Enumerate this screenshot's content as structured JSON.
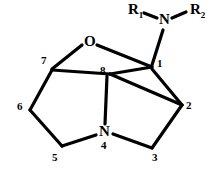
{
  "figure": {
    "kind": "chemical-structure-diagram",
    "width": 220,
    "height": 172,
    "background_color": "#ffffff",
    "line_color": "#000000"
  },
  "atoms": {
    "oxygen": {
      "label": "O",
      "x": 89,
      "y": 41
    },
    "ring_nitrogen": {
      "label": "N",
      "x": 104,
      "y": 133
    },
    "amine_nitrogen": {
      "label": "N",
      "x": 164,
      "y": 20
    }
  },
  "substituents": {
    "r1": {
      "label": "R",
      "subscript": "1",
      "x": 131,
      "y": 10
    },
    "r2": {
      "label": "R",
      "subscript": "2",
      "x": 192,
      "y": 10
    }
  },
  "locants": [
    {
      "label": "1",
      "x": 158,
      "y": 60
    },
    {
      "label": "2",
      "x": 186,
      "y": 101
    },
    {
      "label": "3",
      "x": 152,
      "y": 152
    },
    {
      "label": "4",
      "x": 101,
      "y": 141
    },
    {
      "label": "5",
      "x": 52,
      "y": 152
    },
    {
      "label": "6",
      "x": 17,
      "y": 102
    },
    {
      "label": "7",
      "x": 42,
      "y": 56
    },
    {
      "label": "8",
      "x": 101,
      "y": 66
    }
  ],
  "vertices": {
    "c1": {
      "x": 152,
      "y": 66
    },
    "c2": {
      "x": 182,
      "y": 105
    },
    "c3": {
      "x": 152,
      "y": 148
    },
    "n4": {
      "x": 104,
      "y": 133
    },
    "c5": {
      "x": 62,
      "y": 146
    },
    "c6": {
      "x": 30,
      "y": 110
    },
    "c7": {
      "x": 52,
      "y": 70
    },
    "c8": {
      "x": 110,
      "y": 73
    },
    "o": {
      "x": 89,
      "y": 47
    },
    "namine": {
      "x": 164,
      "y": 28
    }
  },
  "bonds": [
    {
      "name": "bond-c7-o",
      "from": "c7",
      "to": "o"
    },
    {
      "name": "bond-o-c1",
      "from": "o",
      "to": "c1"
    },
    {
      "name": "bond-c7-c8",
      "from": "c7",
      "to": "c8"
    },
    {
      "name": "bond-c7-c6",
      "from": "c7",
      "to": "c6"
    },
    {
      "name": "bond-c6-c5",
      "from": "c6",
      "to": "c5"
    },
    {
      "name": "bond-c5-n4",
      "from": "c5",
      "to": "n4"
    },
    {
      "name": "bond-c8-n4",
      "from": "c8",
      "to": "n4"
    },
    {
      "name": "bond-c8-c2",
      "from": "c8",
      "to": "c2"
    },
    {
      "name": "bond-c8-c1",
      "from": "c8",
      "to": "c1"
    },
    {
      "name": "bond-c1-c2",
      "from": "c1",
      "to": "c2"
    },
    {
      "name": "bond-c2-c3",
      "from": "c2",
      "to": "c3"
    },
    {
      "name": "bond-c3-n4",
      "from": "c3",
      "to": "n4"
    },
    {
      "name": "bond-c1-namine",
      "from": "c1",
      "to": "namine"
    },
    {
      "name": "bond-namine-r1",
      "from": "namine",
      "to": "r1anchor"
    },
    {
      "name": "bond-namine-r2",
      "from": "namine",
      "to": "r2anchor"
    }
  ]
}
